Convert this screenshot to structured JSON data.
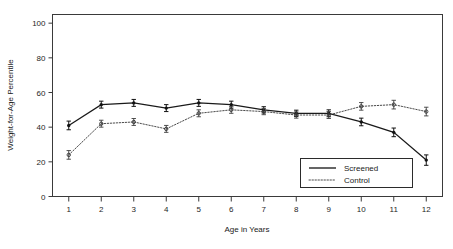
{
  "chart_data": {
    "type": "line",
    "title": "",
    "subtitle": "",
    "xlabel": "Age in Years",
    "ylabel": "Weight-for-Age Percentile",
    "x": [
      1,
      2,
      3,
      4,
      5,
      6,
      7,
      8,
      9,
      10,
      11,
      12
    ],
    "xtick_labels": [
      "1",
      "2",
      "3",
      "4",
      "5",
      "6",
      "7",
      "8",
      "9",
      "10",
      "11",
      "12"
    ],
    "ytick_labels": [
      "0",
      "20",
      "40",
      "60",
      "80",
      "100"
    ],
    "yticks": [
      0,
      20,
      40,
      60,
      80,
      100
    ],
    "xlim": [
      0.5,
      12.5
    ],
    "ylim": [
      0,
      105
    ],
    "grid": false,
    "legend_position": "bottom-right",
    "series": [
      {
        "name": "Screened",
        "style": "solid",
        "marker": "filled-errorbar",
        "values": [
          41,
          53,
          54,
          51,
          54,
          53,
          50,
          48,
          48,
          43,
          37,
          21
        ],
        "err_low": [
          2.5,
          2.0,
          2.0,
          2.0,
          2.0,
          2.0,
          1.8,
          1.8,
          2.0,
          2.2,
          2.5,
          3.0
        ],
        "err_high": [
          2.5,
          2.0,
          2.0,
          2.0,
          2.0,
          2.0,
          1.8,
          1.8,
          2.0,
          2.2,
          2.5,
          3.0
        ]
      },
      {
        "name": "Control",
        "style": "dotted",
        "marker": "open-errorbar",
        "values": [
          24,
          42,
          43,
          39,
          48,
          50,
          49,
          47,
          47,
          52,
          53,
          49
        ],
        "err_low": [
          2.5,
          2.0,
          2.0,
          2.0,
          2.0,
          2.0,
          1.8,
          1.8,
          2.0,
          2.2,
          2.5,
          2.5
        ],
        "err_high": [
          2.5,
          2.0,
          2.0,
          2.0,
          2.0,
          2.0,
          1.8,
          1.8,
          2.0,
          2.2,
          2.5,
          2.5
        ]
      }
    ]
  },
  "legend": {
    "entries": [
      {
        "label": "Screened"
      },
      {
        "label": "Control"
      }
    ]
  },
  "axes": {
    "x_title": "Age in Years",
    "y_title": "Weight-for-Age Percentile"
  }
}
